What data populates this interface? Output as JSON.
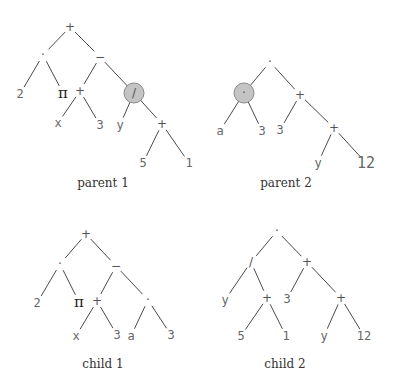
{
  "figure": {
    "trees": [
      {
        "id": "parent1",
        "caption": "parent 1",
        "nodes": [
          {
            "id": "p1n0",
            "label": "+",
            "kind": "op"
          },
          {
            "id": "p1n1",
            "label": "·",
            "kind": "op",
            "parent": "p1n0"
          },
          {
            "id": "p1n2",
            "label": "−",
            "kind": "op",
            "parent": "p1n0"
          },
          {
            "id": "p1n3",
            "label": "2",
            "kind": "leaf",
            "parent": "p1n1"
          },
          {
            "id": "p1n4",
            "label": "π",
            "kind": "pi",
            "parent": "p1n1"
          },
          {
            "id": "p1n5",
            "label": "+",
            "kind": "op",
            "parent": "p1n2"
          },
          {
            "id": "p1n6",
            "label": "/",
            "kind": "op",
            "parent": "p1n2",
            "highlighted": true
          },
          {
            "id": "p1n7",
            "label": "x",
            "kind": "leaf",
            "parent": "p1n5"
          },
          {
            "id": "p1n8",
            "label": "3",
            "kind": "leaf",
            "parent": "p1n5"
          },
          {
            "id": "p1n9",
            "label": "y",
            "kind": "leaf",
            "parent": "p1n6"
          },
          {
            "id": "p1n10",
            "label": "+",
            "kind": "op",
            "parent": "p1n6"
          },
          {
            "id": "p1n11",
            "label": "5",
            "kind": "leaf",
            "parent": "p1n10"
          },
          {
            "id": "p1n12",
            "label": "1",
            "kind": "leaf",
            "parent": "p1n10"
          }
        ]
      },
      {
        "id": "parent2",
        "caption": "parent 2",
        "nodes": [
          {
            "id": "p2n0",
            "label": "·",
            "kind": "op"
          },
          {
            "id": "p2n1",
            "label": "·",
            "kind": "op",
            "parent": "p2n0",
            "highlighted": true
          },
          {
            "id": "p2n2",
            "label": "+",
            "kind": "op",
            "parent": "p2n0"
          },
          {
            "id": "p2n3",
            "label": "a",
            "kind": "leaf",
            "parent": "p2n1"
          },
          {
            "id": "p2n4",
            "label": "3",
            "kind": "leaf",
            "parent": "p2n1"
          },
          {
            "id": "p2n5",
            "label": "3",
            "kind": "leaf",
            "parent": "p2n2"
          },
          {
            "id": "p2n6",
            "label": "+",
            "kind": "op",
            "parent": "p2n2"
          },
          {
            "id": "p2n7",
            "label": "y",
            "kind": "leaf",
            "parent": "p2n6"
          },
          {
            "id": "p2n8",
            "label": "12",
            "kind": "big",
            "parent": "p2n6"
          }
        ]
      },
      {
        "id": "child1",
        "caption": "child 1",
        "nodes": [
          {
            "id": "c1n0",
            "label": "+",
            "kind": "op"
          },
          {
            "id": "c1n1",
            "label": "·",
            "kind": "op",
            "parent": "c1n0"
          },
          {
            "id": "c1n2",
            "label": "−",
            "kind": "op",
            "parent": "c1n0"
          },
          {
            "id": "c1n3",
            "label": "2",
            "kind": "leaf",
            "parent": "c1n1"
          },
          {
            "id": "c1n4",
            "label": "π",
            "kind": "pi",
            "parent": "c1n1"
          },
          {
            "id": "c1n5",
            "label": "+",
            "kind": "op",
            "parent": "c1n2"
          },
          {
            "id": "c1n6",
            "label": "·",
            "kind": "op",
            "parent": "c1n2"
          },
          {
            "id": "c1n7",
            "label": "x",
            "kind": "leaf",
            "parent": "c1n5"
          },
          {
            "id": "c1n8",
            "label": "3",
            "kind": "leaf",
            "parent": "c1n5"
          },
          {
            "id": "c1n9",
            "label": "a",
            "kind": "leaf",
            "parent": "c1n6"
          },
          {
            "id": "c1n10",
            "label": "3",
            "kind": "leaf",
            "parent": "c1n6"
          }
        ]
      },
      {
        "id": "child2",
        "caption": "child 2",
        "nodes": [
          {
            "id": "c2n0",
            "label": "·",
            "kind": "op"
          },
          {
            "id": "c2n1",
            "label": "/",
            "kind": "op",
            "parent": "c2n0"
          },
          {
            "id": "c2n2",
            "label": "+",
            "kind": "op",
            "parent": "c2n0"
          },
          {
            "id": "c2n3",
            "label": "y",
            "kind": "leaf",
            "parent": "c2n1"
          },
          {
            "id": "c2n4",
            "label": "+",
            "kind": "op",
            "parent": "c2n1"
          },
          {
            "id": "c2n5",
            "label": "3",
            "kind": "leaf",
            "parent": "c2n2"
          },
          {
            "id": "c2n6",
            "label": "+",
            "kind": "op",
            "parent": "c2n2"
          },
          {
            "id": "c2n7",
            "label": "5",
            "kind": "leaf",
            "parent": "c2n4"
          },
          {
            "id": "c2n8",
            "label": "1",
            "kind": "leaf",
            "parent": "c2n4"
          },
          {
            "id": "c2n9",
            "label": "y",
            "kind": "leaf",
            "parent": "c2n6"
          },
          {
            "id": "c2n10",
            "label": "12",
            "kind": "leaf",
            "parent": "c2n6"
          }
        ]
      }
    ]
  }
}
